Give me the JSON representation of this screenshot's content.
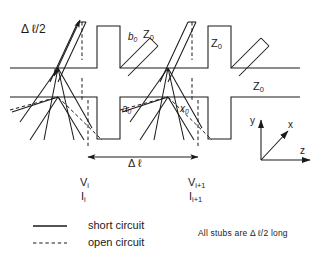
{
  "figure": {
    "title_labels": {
      "delta_l_half": "Δ ℓ/2",
      "delta_l": "Δ ℓ"
    },
    "impedance_labels": [
      {
        "id": "z0-vertical-stub",
        "text": "Z",
        "sub": "0"
      },
      {
        "id": "z0-diagonal-stub",
        "text": "Z",
        "sub": "0"
      },
      {
        "id": "z0-main-line",
        "text": "Z",
        "sub": "0"
      }
    ],
    "stub_labels": [
      {
        "id": "b0-upper-diagonal",
        "text": "b",
        "sub": "0"
      },
      {
        "id": "a0-lower-diagonal",
        "text": "a",
        "sub": "0"
      },
      {
        "id": "x0-lower-right",
        "text": "x",
        "sub": "0"
      }
    ],
    "port_labels": [
      {
        "id": "port-left-voltage",
        "text": "V",
        "sub": "i"
      },
      {
        "id": "port-left-current",
        "text": "I",
        "sub": "i"
      },
      {
        "id": "port-right-voltage",
        "text": "V",
        "sub": "i+1"
      },
      {
        "id": "port-right-current",
        "text": "I",
        "sub": "i+1"
      }
    ],
    "axes": {
      "x_label": "x",
      "y_label": "y",
      "z_label": "z"
    },
    "legend": [
      {
        "id": "legend-short-circuit",
        "style": "solid",
        "label": "short  circuit"
      },
      {
        "id": "legend-open-circuit",
        "style": "dashed",
        "label": "open  circuit"
      }
    ],
    "note": "All  stubs  are  Δ ℓ/2  long",
    "colors": {
      "line": "#1a1a1a",
      "background": "#ffffff",
      "text": "#1a1a1a"
    }
  }
}
